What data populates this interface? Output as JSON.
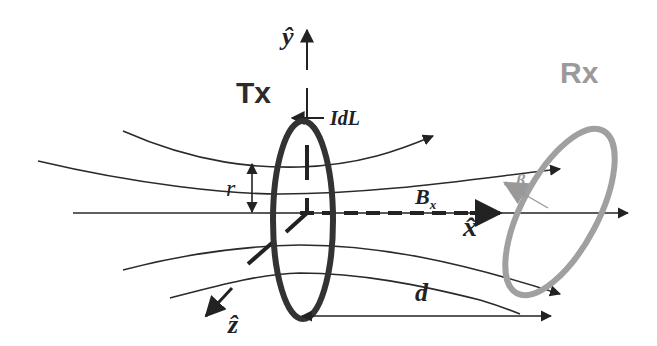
{
  "diagram": {
    "transmitter_label": "Tx",
    "receiver_label": "Rx",
    "axes": {
      "y": "ŷ",
      "x": "x̂",
      "z": "ẑ"
    },
    "current_element": "IdL",
    "radius_label": "r",
    "field_label": "B",
    "field_subscript": "x",
    "distance_label": "d",
    "angle_label": "β",
    "colors": {
      "tx_coil": "#333333",
      "rx_coil": "#a0a0a0",
      "lines": "#222222"
    }
  }
}
